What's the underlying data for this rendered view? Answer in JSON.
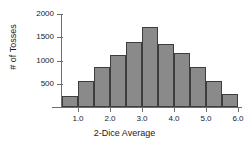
{
  "chart_data": {
    "type": "bar",
    "title": "",
    "xlabel": "2-Dice Average",
    "ylabel": "# of Tosses",
    "categories": [
      "0.75",
      "1.25",
      "1.75",
      "2.25",
      "2.75",
      "3.25",
      "3.75",
      "4.25",
      "4.75",
      "5.25",
      "5.75"
    ],
    "values": [
      230,
      560,
      850,
      1120,
      1390,
      1720,
      1350,
      1160,
      860,
      570,
      280
    ],
    "bin_width": 0.5,
    "bin_edges": [
      0.5,
      1.0,
      1.5,
      2.0,
      2.5,
      3.0,
      3.5,
      4.0,
      4.5,
      5.0,
      5.5,
      6.0
    ],
    "xlim": [
      0.5,
      6.0
    ],
    "ylim": [
      0,
      2000
    ],
    "x_ticks": [
      1.0,
      2.0,
      3.0,
      4.0,
      5.0,
      6.0
    ],
    "x_tick_labels": [
      "1.0",
      "2.0",
      "3.0",
      "4.0",
      "5.0",
      "6.0"
    ],
    "y_ticks": [
      500,
      1000,
      1500,
      2000
    ],
    "y_tick_labels": [
      "500",
      "1000",
      "1500",
      "2000"
    ],
    "grid": false,
    "legend": false,
    "bar_color": "#8a8a8a",
    "bar_edge_color": "#3d3d3d",
    "axis_color": "#6e6e6e"
  }
}
